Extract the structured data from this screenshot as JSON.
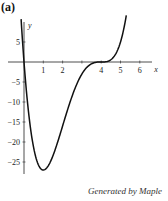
{
  "panel_label": "(a)",
  "footer": "Generated by Maple",
  "chart_data": {
    "type": "line",
    "title": "",
    "xlabel": "x",
    "ylabel": "y",
    "function": "y = x(x-4)^3",
    "xlim": [
      -0.2,
      6.8
    ],
    "ylim": [
      -28,
      10
    ],
    "x_ticks": [
      1,
      2,
      3,
      4,
      5,
      6
    ],
    "x_tick_labels": [
      "1",
      "2",
      "",
      "4",
      "5",
      "6"
    ],
    "y_ticks": [
      5,
      -5,
      -10,
      -15,
      -20,
      -25
    ],
    "y_tick_labels": [
      "5",
      "−5",
      "−10",
      "−15",
      "−20",
      "−25"
    ],
    "grid": false,
    "legend": null,
    "series": [
      {
        "name": "y = x(x-4)^3",
        "x": [
          -0.15,
          0,
          0.25,
          0.5,
          0.75,
          1,
          1.25,
          1.5,
          2,
          2.5,
          3,
          3.5,
          4,
          4.5,
          5,
          5.3
        ],
        "y": [
          10.7,
          0,
          -13.2,
          -21.4,
          -25.7,
          -27,
          -26,
          -23.4,
          -16,
          -8.4,
          -3,
          -0.44,
          0,
          0.56,
          5,
          11.6
        ]
      }
    ],
    "annotations": [
      {
        "text": "minimum",
        "x": 1,
        "y": -27
      },
      {
        "text": "inflection/triple root",
        "x": 4,
        "y": 0
      }
    ]
  }
}
